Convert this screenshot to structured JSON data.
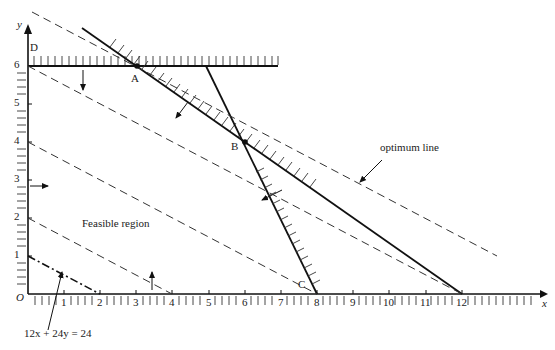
{
  "diagram": {
    "type": "linear-programming-graph",
    "axes": {
      "x_label": "x",
      "y_label": "y",
      "origin_label": "O",
      "x_ticks": [
        "1",
        "2",
        "3",
        "4",
        "5",
        "6",
        "7",
        "8",
        "9",
        "10",
        "11",
        "12"
      ],
      "y_ticks": [
        "1",
        "2",
        "3",
        "4",
        "5",
        "6"
      ]
    },
    "points": {
      "A": {
        "label": "A",
        "x": 3,
        "y": 6
      },
      "B": {
        "label": "B",
        "x": 6,
        "y": 4
      },
      "C": {
        "label": "C",
        "x": 8,
        "y": 0
      },
      "D": {
        "label": "D",
        "x": 0,
        "y": 6
      }
    },
    "constraints": [
      {
        "name": "y <= 6",
        "from": [
          0,
          6
        ],
        "to": [
          7,
          6
        ],
        "style": "solid-hatched"
      },
      {
        "name": "2x + 3y <= 24",
        "from": [
          1.5,
          7
        ],
        "to": [
          12,
          0
        ],
        "style": "solid-hatched"
      },
      {
        "name": "2x + y <= 16",
        "from": [
          5,
          6
        ],
        "to": [
          8,
          0
        ],
        "style": "solid-hatched"
      }
    ],
    "iso_lines": [
      {
        "name": "optimum line",
        "style": "dashed"
      },
      {
        "name": "x + 2y = 12",
        "from": [
          0,
          6
        ],
        "to": [
          12,
          0
        ],
        "style": "dashed"
      },
      {
        "name": "x + 2y = 8",
        "from": [
          0,
          4
        ],
        "to": [
          8,
          0
        ],
        "style": "dashed"
      },
      {
        "name": "x + 2y = 4",
        "from": [
          0,
          2
        ],
        "to": [
          4,
          0
        ],
        "style": "dashed"
      },
      {
        "name": "12x + 24y = 24",
        "from": [
          0,
          1
        ],
        "to": [
          2,
          0
        ],
        "style": "dash-dot"
      }
    ],
    "annotations": {
      "feasible_region": "Feasible region",
      "optimum_line": "optimum line",
      "objective_label": "12x + 24y = 24"
    }
  }
}
